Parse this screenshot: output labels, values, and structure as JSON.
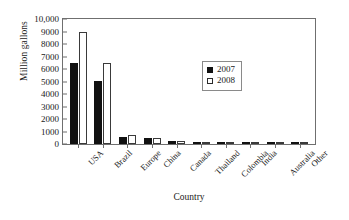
{
  "chart_data": {
    "type": "bar",
    "title": "",
    "xlabel": "Country",
    "ylabel": "Million gallons",
    "ylim": [
      0,
      10000
    ],
    "yticks": [
      0,
      1000,
      2000,
      3000,
      4000,
      5000,
      6000,
      7000,
      8000,
      9000,
      10000
    ],
    "ytick_labels": [
      "0",
      "1000",
      "2000",
      "3000",
      "4000",
      "5000",
      "6000",
      "7000",
      "8000",
      "9000",
      "10,000"
    ],
    "grid": false,
    "legend_position": "inside-center-right",
    "categories": [
      "USA",
      "Brazil",
      "Europe",
      "China",
      "Canada",
      "Thailand",
      "Colombia",
      "India",
      "Australia",
      "Other"
    ],
    "series": [
      {
        "name": "2007",
        "color": "#111111",
        "fill": "solid",
        "values": [
          6500,
          5050,
          570,
          490,
          210,
          80,
          75,
          60,
          55,
          90
        ]
      },
      {
        "name": "2008",
        "color": "#ffffff",
        "fill": "open",
        "values": [
          9000,
          6450,
          730,
          500,
          240,
          90,
          85,
          70,
          60,
          120
        ]
      }
    ]
  },
  "legend": {
    "entries": [
      {
        "label": "2007",
        "swatch": "filled-square"
      },
      {
        "label": "2008",
        "swatch": "open-square"
      }
    ]
  },
  "colors": {
    "series_2007": "#111111",
    "series_2008": "#ffffff",
    "axis": "#6f6f6f",
    "text": "#1a1a1a",
    "background": "#ffffff"
  }
}
